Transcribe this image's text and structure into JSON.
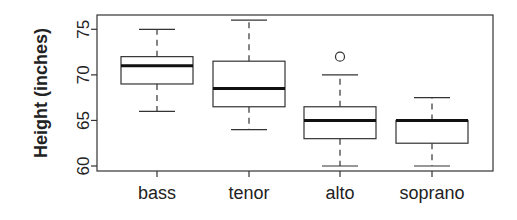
{
  "chart_data": {
    "type": "boxplot",
    "title": "",
    "xlabel": "",
    "ylabel": "Height (inches)",
    "ylim": [
      59.5,
      76.5
    ],
    "yticks": [
      60,
      65,
      70,
      75
    ],
    "grid": false,
    "legend": null,
    "categories": [
      "bass",
      "tenor",
      "alto",
      "soprano"
    ],
    "boxes": [
      {
        "name": "bass",
        "whisker_low": 66,
        "q1": 69,
        "median": 71,
        "q3": 72,
        "whisker_high": 75,
        "outliers": []
      },
      {
        "name": "tenor",
        "whisker_low": 64,
        "q1": 66.5,
        "median": 68.5,
        "q3": 71.5,
        "whisker_high": 76,
        "outliers": []
      },
      {
        "name": "alto",
        "whisker_low": 60,
        "q1": 63,
        "median": 65,
        "q3": 66.5,
        "whisker_high": 70,
        "outliers": [
          72
        ]
      },
      {
        "name": "soprano",
        "whisker_low": 60,
        "q1": 62.5,
        "median": 65,
        "q3": 65,
        "whisker_high": 67.5,
        "outliers": []
      }
    ]
  }
}
